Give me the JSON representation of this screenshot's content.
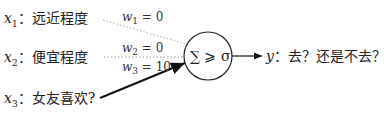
{
  "inputs": [
    {
      "var": "x",
      "sub": "1",
      "label": "：远近程度"
    },
    {
      "var": "x",
      "sub": "2",
      "label": "：便宜程度"
    },
    {
      "var": "x",
      "sub": "3",
      "label": "：女友喜欢?"
    }
  ],
  "weights": [
    {
      "var": "w",
      "sub": "1",
      "value": " = 0",
      "style": "dotted-light"
    },
    {
      "var": "w",
      "sub": "2",
      "value": " = 0",
      "style": "dotted"
    },
    {
      "var": "w",
      "sub": "3",
      "value": " = 10",
      "style": "solid-thick"
    }
  ],
  "neuron": {
    "label": "∑ ⩾ σ"
  },
  "output": {
    "var": "y",
    "label": "：去？还是不去？"
  }
}
